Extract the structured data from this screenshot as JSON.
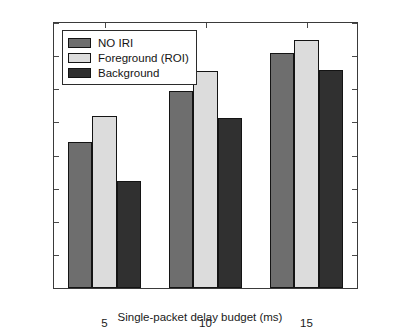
{
  "chart_data": {
    "type": "bar",
    "title": "",
    "xlabel": "Single-packet delay budget (ms)",
    "ylabel": "PSNR (dB)",
    "categories": [
      "5",
      "10",
      "15"
    ],
    "series": [
      {
        "name": "NO IRI",
        "color": "#6e6e6e",
        "values": [
          22.1,
          29.7,
          35.4
        ]
      },
      {
        "name": "Foreground (ROI)",
        "color": "#dcdcdc",
        "values": [
          26.0,
          32.7,
          37.4
        ]
      },
      {
        "name": "Background",
        "color": "#303030",
        "values": [
          16.1,
          25.6,
          32.9
        ]
      }
    ],
    "ylim": [
      0,
      40
    ],
    "yticks": [
      0,
      5,
      10,
      15,
      20,
      25,
      30,
      35,
      40
    ],
    "ytick_labels": [
      "0",
      "5",
      "10",
      "15",
      "20",
      "25",
      "30",
      "35",
      "40"
    ],
    "xtick_labels": [
      "5",
      "10",
      "15"
    ],
    "grid": false,
    "legend_position": "top-left",
    "axis_color": "#3a3a3a",
    "bar_edge_color": "#141414",
    "background_color": "#ffffff"
  }
}
